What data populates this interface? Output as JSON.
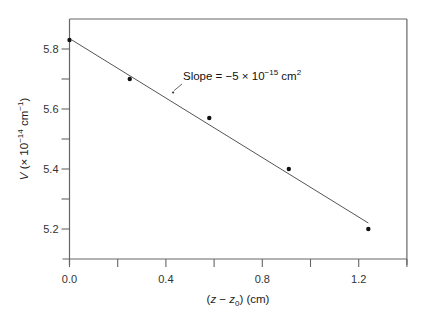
{
  "chart_data": {
    "type": "scatter",
    "title": "",
    "xlabel": "(z − z0) (cm)",
    "xlabel_parts": {
      "open": "(",
      "var": "z",
      "minus": " − ",
      "var2": "z",
      "sub": "0",
      "close": ") (cm)"
    },
    "ylabel": "V (× 10^-14 cm^-1)",
    "ylabel_parts": {
      "var": "V",
      "pre": " (× 10",
      "exp": "−14",
      "unit": " cm",
      "unit_exp": "−1",
      "close": ")"
    },
    "xlim": [
      0.0,
      1.4
    ],
    "ylim": [
      5.1,
      5.9
    ],
    "x_ticks": [
      0.0,
      0.2,
      0.4,
      0.6,
      0.8,
      1.0,
      1.2,
      1.4
    ],
    "x_tick_labels": [
      "0.0",
      "",
      "0.4",
      "",
      "0.8",
      "",
      "1.2",
      ""
    ],
    "y_ticks": [
      5.2,
      5.3,
      5.4,
      5.5,
      5.6,
      5.7,
      5.8
    ],
    "y_tick_labels": [
      "5.2",
      "",
      "5.4",
      "",
      "5.6",
      "",
      "5.8"
    ],
    "grid": false,
    "legend": null,
    "series": [
      {
        "name": "measured",
        "style": "points",
        "x": [
          0.0,
          0.25,
          0.58,
          0.91,
          1.24
        ],
        "y": [
          5.83,
          5.7,
          5.57,
          5.4,
          5.2
        ]
      },
      {
        "name": "linear fit",
        "style": "line",
        "x": [
          0.01,
          1.24
        ],
        "y": [
          5.83,
          5.22
        ]
      }
    ],
    "annotations": [
      {
        "text": "Slope = −5 × 10^-15 cm^2",
        "parts": {
          "pre": "Slope = −5 × 10",
          "exp": "−15",
          "unit": " cm",
          "unit_exp": "2"
        },
        "arrow_to": [
          0.43,
          5.655
        ]
      }
    ]
  }
}
